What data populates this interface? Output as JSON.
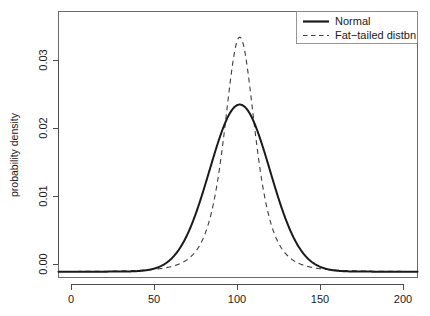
{
  "chart_data": {
    "type": "line",
    "title": "",
    "subtitle": "",
    "xlabel": "",
    "ylabel": "probability density",
    "xlim": [
      -3,
      205
    ],
    "ylim": [
      -0.0008,
      0.0355
    ],
    "grid": false,
    "legend_position": "top-right",
    "x_ticks": [
      0,
      50,
      100,
      150,
      200
    ],
    "x_tick_labels": [
      "0",
      "50",
      "100",
      "150",
      "200"
    ],
    "y_ticks": [
      0.0,
      0.01,
      0.02,
      0.03
    ],
    "y_tick_labels": [
      "0.00",
      "0.01",
      "0.02",
      "0.03"
    ],
    "series": [
      {
        "name": "Normal",
        "style": "solid",
        "color": "#1a1a1a",
        "peak_x": 102,
        "peak_y": 0.0228,
        "distribution": "normal",
        "mean": 102,
        "sd": 17.5,
        "x": [
          0,
          10,
          20,
          30,
          40,
          45,
          50,
          55,
          60,
          65,
          70,
          75,
          80,
          85,
          90,
          95,
          100,
          102,
          105,
          110,
          115,
          120,
          125,
          130,
          135,
          140,
          145,
          150,
          155,
          160,
          170,
          180,
          190,
          200
        ],
        "y": [
          0.0,
          0.0,
          0.0,
          1e-05,
          6e-05,
          0.00014,
          0.00029,
          0.00057,
          0.00104,
          0.00178,
          0.00285,
          0.00424,
          0.00587,
          0.00758,
          0.00911,
          0.01022,
          0.0218,
          0.0228,
          0.02255,
          0.02059,
          0.01765,
          0.01416,
          0.01062,
          0.00745,
          0.00488,
          0.00299,
          0.00171,
          0.00091,
          0.00045,
          0.00021,
          4e-05,
          0.0,
          0.0,
          0.0
        ]
      },
      {
        "name": "Fat−tailed distbn",
        "style": "dashed",
        "color": "#3d3d3d",
        "peak_x": 102,
        "peak_y": 0.032,
        "distribution": "student-t",
        "mean": 102,
        "scale": 9.5,
        "df": 3,
        "x": [
          0,
          10,
          20,
          30,
          40,
          50,
          55,
          60,
          65,
          70,
          75,
          80,
          85,
          90,
          95,
          100,
          102,
          105,
          110,
          115,
          120,
          125,
          130,
          135,
          140,
          145,
          150,
          160,
          170,
          180,
          190,
          200
        ],
        "y": [
          0.00019,
          0.00022,
          0.00026,
          0.00031,
          0.00039,
          0.00052,
          0.00061,
          0.00073,
          0.0009,
          0.00114,
          0.0015,
          0.00207,
          0.00302,
          0.00476,
          0.00845,
          0.0283,
          0.032,
          0.0265,
          0.014,
          0.0076,
          0.00465,
          0.00312,
          0.00225,
          0.0017,
          0.00134,
          0.00109,
          0.00091,
          0.00066,
          0.0005,
          0.0004,
          0.00033,
          0.00028
        ]
      }
    ]
  },
  "legend": {
    "entries": [
      {
        "label": "Normal",
        "style": "solid"
      },
      {
        "label": "Fat−tailed distbn",
        "style": "dashed"
      }
    ]
  },
  "axes": {
    "y_title": "probability density",
    "x_tick_labels": [
      "0",
      "50",
      "100",
      "150",
      "200"
    ],
    "y_tick_labels": [
      "0.00",
      "0.01",
      "0.02",
      "0.03"
    ]
  },
  "colors": {
    "background": "#ffffff",
    "foreground": "#1a1a1a",
    "axis": "#4d4d4d",
    "box": "#6b6b6b",
    "series_normal": "#1a1a1a",
    "series_fat_tailed": "#3d3d3d"
  }
}
